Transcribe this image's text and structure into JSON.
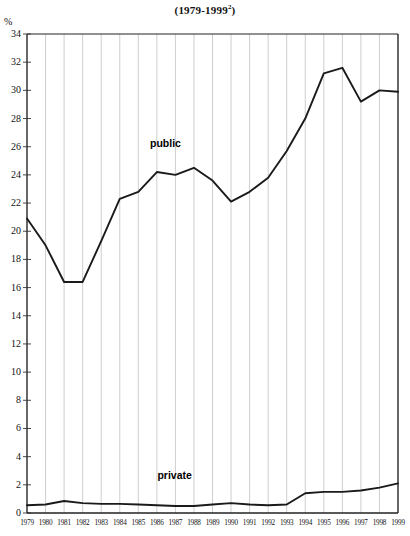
{
  "chart_data": {
    "type": "line",
    "title": "(1979-1999",
    "title_sup": "2",
    "title_suffix": ")",
    "ylabel": "%",
    "xlabel": "",
    "grid": true,
    "gridlines": "vertical",
    "legend_position": "inline-annotation",
    "ylim": [
      0,
      34
    ],
    "ytick_step": 2,
    "yticks": [
      "34",
      "32",
      "30",
      "28",
      "26",
      "24",
      "22",
      "20",
      "18",
      "16",
      "14",
      "12",
      "10",
      "8",
      "6",
      "4",
      "2",
      "0"
    ],
    "categories": [
      "1979",
      "1980",
      "1981",
      "1982",
      "1983",
      "1984",
      "1985",
      "1986",
      "1987",
      "1988",
      "1989",
      "1990",
      "1991",
      "1992",
      "1993",
      "1994",
      "1995",
      "1996",
      "1997",
      "1998",
      "1999"
    ],
    "series": [
      {
        "name": "public",
        "color": "#1a1a1a",
        "values": [
          20.9,
          19.0,
          16.4,
          16.4,
          19.3,
          22.3,
          22.8,
          24.2,
          24.0,
          24.5,
          23.6,
          22.1,
          22.8,
          23.8,
          25.7,
          28.0,
          31.2,
          31.6,
          29.2,
          30.0,
          29.9
        ]
      },
      {
        "name": "private",
        "color": "#1a1a1a",
        "values": [
          0.55,
          0.6,
          0.85,
          0.7,
          0.65,
          0.65,
          0.6,
          0.55,
          0.5,
          0.5,
          0.6,
          0.7,
          0.6,
          0.55,
          0.6,
          1.4,
          1.5,
          1.5,
          1.6,
          1.8,
          2.1
        ]
      }
    ],
    "annotations": [
      {
        "text": "public",
        "x": 1986.6,
        "y": 26.2
      },
      {
        "text": "private",
        "x": 1987.0,
        "y": 2.6
      }
    ]
  },
  "plot_geometry": {
    "left": 27,
    "right": 398,
    "top": 34,
    "bottom": 513
  }
}
